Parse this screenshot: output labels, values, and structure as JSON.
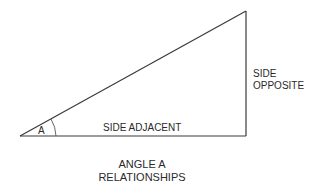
{
  "diagram": {
    "title_line1": "ANGLE A",
    "title_line2": "RELATIONSHIPS",
    "angle_label": "A",
    "side_adjacent": "SIDE ADJACENT",
    "side_opposite_line1": "SIDE",
    "side_opposite_line2": "OPPOSITE",
    "line_color": "#3a3a3a",
    "vertices": {
      "angle_a": [
        20,
        136
      ],
      "right_angle": [
        246,
        136
      ],
      "top": [
        246,
        11
      ]
    }
  }
}
